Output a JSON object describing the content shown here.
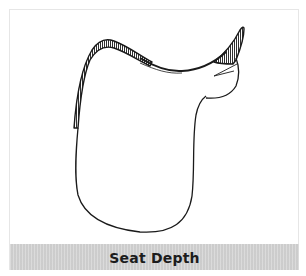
{
  "figure": {
    "illustration": {
      "subject": "saddle-line-drawing",
      "stroke_color": "#1a1a1a"
    },
    "caption": {
      "text": "Seat Depth",
      "band_color": "#d3d3d3",
      "text_color": "#1c1c1c"
    }
  }
}
